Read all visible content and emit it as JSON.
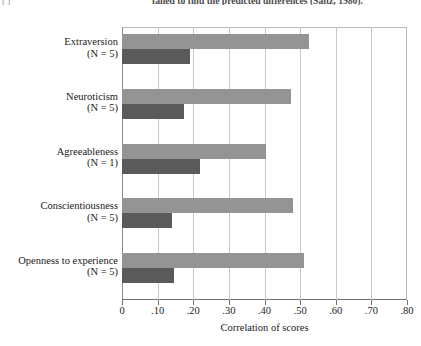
{
  "page_text": {
    "fragment_left": "[  ]",
    "fragment_right": "failed to find the predicted differences (Saitz, 1980)."
  },
  "chart_data": {
    "type": "bar",
    "orientation": "horizontal",
    "title": "",
    "subtitle": "",
    "xlabel": "Correlation of scores",
    "ylabel": "",
    "xlim": [
      0,
      0.8
    ],
    "grid": true,
    "legend_position": "none",
    "xtick_labels": [
      "0",
      ".10",
      ".20",
      ".30",
      ".40",
      ".50",
      ".60",
      ".70",
      ".80"
    ],
    "xtick_values": [
      0,
      0.1,
      0.2,
      0.3,
      0.4,
      0.5,
      0.6,
      0.7,
      0.8
    ],
    "categories": [
      "Extraversion",
      "Neuroticism",
      "Agreeableness",
      "Conscientiousness",
      "Openness to experience"
    ],
    "category_counts": [
      "(N = 5)",
      "(N = 5)",
      "(N = 1)",
      "(N = 5)",
      "(N = 5)"
    ],
    "series": [
      {
        "name": "light-series",
        "color": "#949494",
        "values": [
          0.525,
          0.475,
          0.405,
          0.48,
          0.51
        ]
      },
      {
        "name": "dark-series",
        "color": "#5a5a5a",
        "values": [
          0.19,
          0.175,
          0.22,
          0.14,
          0.145
        ]
      }
    ]
  },
  "colors": {
    "light_bar": "#949494",
    "dark_bar": "#5a5a5a",
    "gridline": "#c8c8c8",
    "axis": "#6e6e6e",
    "text": "#1a1a1a"
  }
}
